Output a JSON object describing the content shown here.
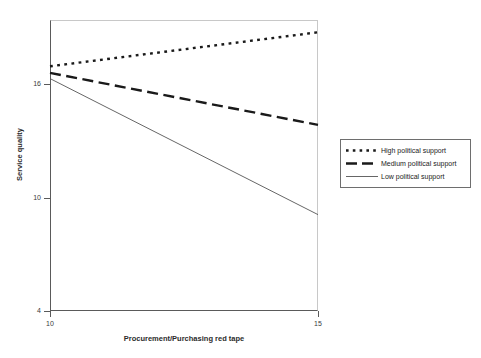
{
  "chart_data": {
    "type": "line",
    "title": "",
    "xlabel": "Procurement/Purchasing red tape",
    "ylabel": "Service quality",
    "xlim": [
      10,
      15
    ],
    "ylim": [
      4,
      19.4
    ],
    "xticks": [
      "10",
      "15"
    ],
    "xtick_values": [
      10,
      15
    ],
    "yticks": [
      "16",
      "10",
      "4"
    ],
    "ytick_values": [
      16,
      10,
      4
    ],
    "grid": false,
    "legend_position": "right",
    "x": [
      10,
      15
    ],
    "series": [
      {
        "name": "High political support",
        "values": [
          16.95,
          18.75
        ],
        "style": "dotted",
        "color": "#1a1a1a",
        "width": 2.4
      },
      {
        "name": "Medium political support",
        "values": [
          16.6,
          13.85
        ],
        "style": "dashed",
        "color": "#1a1a1a",
        "width": 2.4
      },
      {
        "name": "Low political support",
        "values": [
          16.3,
          9.1
        ],
        "style": "solid",
        "color": "#555555",
        "width": 0.9
      }
    ]
  },
  "axes": {
    "y_label": "Service quality",
    "x_label": "Procurement/Purchasing red tape",
    "y_tick_labels": [
      "16",
      "10",
      "4"
    ],
    "x_tick_labels": [
      "10",
      "15"
    ]
  },
  "legend": {
    "items": [
      {
        "label": "High political support"
      },
      {
        "label": "Medium political support"
      },
      {
        "label": "Low political support"
      }
    ]
  }
}
